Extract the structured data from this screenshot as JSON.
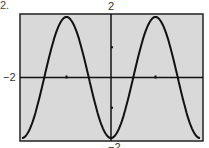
{
  "problem_number": "2.",
  "labels": {
    "ymax": "2",
    "xmin": "−2",
    "ymin": "−2"
  },
  "colors": {
    "screen_bg": "#d9d9d9",
    "curve": "#111111",
    "frame": "#222222"
  },
  "chart_data": {
    "type": "line",
    "title": "",
    "function": "y = -2cos(x)",
    "xlim": [
      -6.283,
      6.283
    ],
    "ylim": [
      -2,
      2
    ],
    "xticks": [
      -3.1416,
      3.1416
    ],
    "yticks": [
      -1,
      1
    ],
    "grid": false,
    "xlabel": "",
    "ylabel": "",
    "series": [
      {
        "name": "y = -2cos(x)",
        "x": [
          -6.283,
          -4.712,
          -3.1416,
          -1.5708,
          0,
          1.5708,
          3.1416,
          4.712,
          6.283
        ],
        "values": [
          -2,
          0,
          2,
          0,
          -2,
          0,
          2,
          0,
          -2
        ]
      }
    ]
  }
}
